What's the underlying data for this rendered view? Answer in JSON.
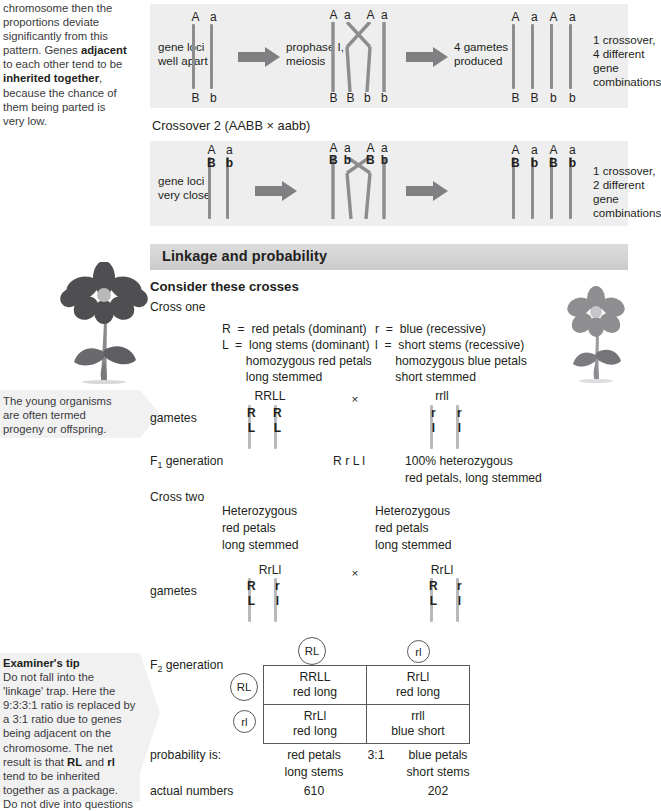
{
  "page": {
    "width": 633,
    "height": 802,
    "panel_bg": "#eeeeef",
    "chromosome_color": "#8d8d90",
    "heading_bar_color": "#d3d3d4",
    "note_bg": "#f1f1f2"
  },
  "margin_notes": {
    "linkage_note": {
      "name": "linkage-explanation-note",
      "lines": [
        {
          "text": "chromosome then the"
        },
        {
          "text": "proportions deviate"
        },
        {
          "text": "significantly from this"
        },
        {
          "text": "pattern. Genes ",
          "bold_tail": "adjacent"
        },
        {
          "text": "to each other tend to be"
        },
        {
          "text": "",
          "bold_tail": "inherited together",
          "tail": ","
        },
        {
          "text": "because the chance of"
        },
        {
          "text": "them being parted is"
        },
        {
          "text": "very low."
        }
      ],
      "plain": "chromosome then the proportions deviate significantly from this pattern. Genes adjacent to each other tend to be inherited together, because the chance of them being parted is very low."
    },
    "progeny_note": {
      "name": "progeny-definition-note",
      "line1": "The young organisms",
      "line2": "are often termed",
      "line3": "progeny or offspring."
    },
    "examiners_tip": {
      "name": "examiners-tip-note",
      "title": "Examiner's tip",
      "line1": "Do not fall into the",
      "line2": "'linkage' trap. Here the",
      "line3": "9:3:3:1 ratio is replaced by",
      "line4": "a 3:1 ratio due to genes",
      "line5": "being adjacent on the",
      "line6": "chromosome. The net",
      "line7_a": "result is that ",
      "line7_b": "RL",
      "line7_c": " and ",
      "line7_d": "rl",
      "line8": "tend to be inherited",
      "line9": "together as a package.",
      "line10": "Do not dive into questions"
    }
  },
  "crossover1": {
    "name": "crossover-1-diagram",
    "stage1_label": "gene loci\nwell apart",
    "stage2_label": "prophase I,\nmeiosis",
    "stage3_label": "4 gametes\nproduced",
    "result_label": "1 crossover,\n4 different gene\ncombinations",
    "stage1_top_alleles": [
      "A",
      "a"
    ],
    "stage1_bottom_alleles": [
      "B",
      "b"
    ],
    "stage2_top_alleles": [
      "A",
      "a",
      "A",
      "a"
    ],
    "stage2_bottom_alleles": [
      "B",
      "B",
      "b",
      "b"
    ],
    "stage3_top_alleles": [
      "A",
      "a",
      "A",
      "a"
    ],
    "stage3_bottom_alleles": [
      "B",
      "B",
      "b",
      "b"
    ]
  },
  "crossover2": {
    "name": "crossover-2-diagram",
    "caption": "Crossover 2 (AABB × aabb)",
    "stage1_label": "gene loci\nvery close",
    "result_label": "1 crossover,\n2 different gene\ncombinations",
    "stage1_top_alleles": [
      "A",
      "a"
    ],
    "stage1_second_alleles": [
      "B",
      "b"
    ],
    "stage2_top_alleles": [
      "A",
      "a",
      "A",
      "a"
    ],
    "stage2_second_alleles": [
      "B",
      "b",
      "B",
      "b"
    ],
    "stage3_top_alleles": [
      "A",
      "a",
      "A",
      "a"
    ],
    "stage3_second_alleles": [
      "B",
      "b",
      "B",
      "b"
    ]
  },
  "section": {
    "heading": "Linkage and probability",
    "subheading": "Consider these crosses"
  },
  "cross_one": {
    "label": "Cross one",
    "key_left": [
      "R  =  red petals (dominant)",
      "L  =  long stems (dominant)",
      "       homozygous red petals",
      "       long stemmed"
    ],
    "key_right": [
      "r  =  blue (recessive)",
      "l  =  short stems (recessive)",
      "      homozygous blue petals",
      "      short stemmed"
    ],
    "parent_left_genotype": "RRLL",
    "cross_symbol": "×",
    "parent_right_genotype": "rrll",
    "gametes_label": "gametes",
    "gamete_left_alleles": [
      [
        "R",
        "L"
      ],
      [
        "R",
        "L"
      ]
    ],
    "gamete_right_alleles": [
      [
        "r",
        "l"
      ],
      [
        "r",
        "l"
      ]
    ],
    "f1_label_pre": "F",
    "f1_label_sub": "1",
    "f1_label_post": " generation",
    "f1_genotype": "R r L l",
    "f1_note_line1": "100% heterozygous",
    "f1_note_line2": "red petals, long stemmed"
  },
  "cross_two": {
    "label": "Cross two",
    "parent_left": [
      "Heterozygous",
      "red petals",
      "long stemmed"
    ],
    "parent_right": [
      "Heterozygous",
      "red petals",
      "long stemmed"
    ],
    "parent_left_genotype": "RrLl",
    "cross_symbol": "×",
    "parent_right_genotype": "RrLl",
    "gametes_label": "gametes",
    "gamete_left_alleles": [
      [
        "R",
        "L"
      ],
      [
        "r",
        "l"
      ]
    ],
    "gamete_right_alleles": [
      [
        "R",
        "L"
      ],
      [
        "r",
        "l"
      ]
    ]
  },
  "punnett": {
    "name": "f2-punnett-square",
    "f2_label_pre": "F",
    "f2_label_sub": "2",
    "f2_label_post": " generation",
    "column_gametes": [
      "RL",
      "rl"
    ],
    "row_gametes": [
      "RL",
      "rl"
    ],
    "cells": [
      [
        {
          "genotype": "RRLL",
          "phenotype": "red long"
        },
        {
          "genotype": "RrLl",
          "phenotype": "red long"
        }
      ],
      [
        {
          "genotype": "RrLl",
          "phenotype": "red long"
        },
        {
          "genotype": "rrll",
          "phenotype": "blue short"
        }
      ]
    ]
  },
  "results": {
    "probability_label": "probability is:",
    "prob_left_line1": "red petals",
    "prob_left_line2": "long stems",
    "ratio": "3:1",
    "prob_right_line1": "blue petals",
    "prob_right_line2": "short stems",
    "actual_label": "actual numbers",
    "actual_left": "610",
    "actual_right": "202"
  },
  "flowers": {
    "red_flower_name": "red-petal-long-stem-flower",
    "blue_flower_name": "blue-petal-short-stem-flower",
    "red_color": "#4f4f52",
    "blue_color": "#8e8e91"
  }
}
